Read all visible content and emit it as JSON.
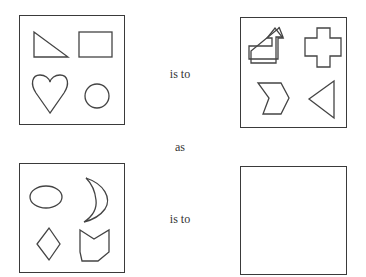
{
  "puzzle": {
    "type": "visual-analogy",
    "connector_top": "is to",
    "connector_middle": "as",
    "connector_bottom": "is to",
    "panels": [
      {
        "id": "A",
        "position": "top-left",
        "shapes": [
          "right-triangle",
          "rectangle",
          "heart",
          "circle"
        ]
      },
      {
        "id": "B",
        "position": "top-right",
        "shapes": [
          "bent-arrow",
          "cross",
          "chevron",
          "triangle-pointing-left"
        ]
      },
      {
        "id": "C",
        "position": "bottom-left",
        "shapes": [
          "ellipse",
          "crescent-moon",
          "diamond",
          "notched-pentagon"
        ]
      },
      {
        "id": "D",
        "position": "bottom-right",
        "shapes": [],
        "state": "empty-answer-box"
      }
    ]
  },
  "colors": {
    "stroke": "#444444",
    "border": "#3a3a3a",
    "text": "#333333",
    "background": "#ffffff"
  }
}
